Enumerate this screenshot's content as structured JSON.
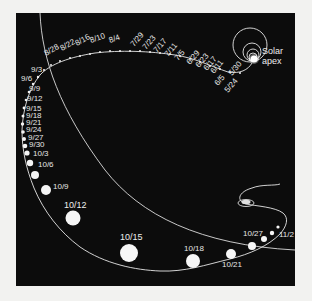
{
  "diagram": {
    "panel_color": "#0c0c0c",
    "background_color": "#f2f2f0",
    "line_color": "#e8e8e8",
    "apex_label_line1": "Solar",
    "apex_label_line2": "apex",
    "top_arc_dates": [
      "8/28",
      "8/22",
      "8/16",
      "8/10",
      "8/4",
      "7/29",
      "7/23",
      "7/17",
      "7/11",
      "7/5",
      "6/29",
      "6/23",
      "6/17",
      "6/11",
      "6/5",
      "5/30",
      "5/24"
    ],
    "left_arc_dates": [
      "9/3",
      "9/6",
      "9/9",
      "9/12",
      "9/15",
      "9/18",
      "9/21",
      "9/24",
      "9/27",
      "9/30",
      "10/3",
      "10/6",
      "10/9",
      "10/12"
    ],
    "bottom_arc_dates": [
      "10/15",
      "10/18",
      "10/21",
      "10/27",
      "11/2"
    ]
  },
  "labels": {
    "d0828": "8/28",
    "d0822": "8/22",
    "d0816": "8/16",
    "d0810": "8/10",
    "d0804": "8/4",
    "d0729": "7/29",
    "d0723": "7/23",
    "d0717": "7/17",
    "d0711": "7/11",
    "d0705": "7/5",
    "d0629": "6/29",
    "d0623": "6/23",
    "d0617": "6/17",
    "d0611": "6/11",
    "d0605": "6/5",
    "d0530": "5/30",
    "d0524": "5/24",
    "d0903": "9/3",
    "d0906": "9/6",
    "d0909": "9/9",
    "d0912": "9/12",
    "d0915": "9/15",
    "d0918": "9/18",
    "d0921": "9/21",
    "d0924": "9/24",
    "d0927": "9/27",
    "d0930": "9/30",
    "d1003": "10/3",
    "d1006": "10/6",
    "d1009": "10/9",
    "d1012": "10/12",
    "d1015": "10/15",
    "d1018": "10/18",
    "d1021": "10/21",
    "d1027": "10/27",
    "d1102": "11/2",
    "apex1": "Solar",
    "apex2": "apex"
  }
}
